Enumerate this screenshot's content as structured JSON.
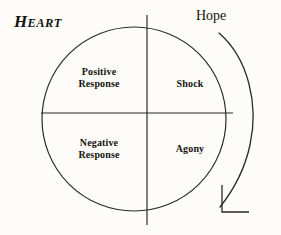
{
  "diagram": {
    "type": "quadrant-circle",
    "background_color": "#fdfcf8",
    "stroke_color": "#2b2a28",
    "text_color": "#15130f",
    "axis_labels": {
      "left_top": "Heart",
      "left_top_cap": "H",
      "left_top_rest": "EART",
      "right_top": "Hope"
    },
    "quadrants": [
      {
        "id": "upper-left",
        "label": "Positive\nResponse"
      },
      {
        "id": "upper-right",
        "label": "Shock"
      },
      {
        "id": "lower-left",
        "label": "Negative\nResponse"
      },
      {
        "id": "lower-right",
        "label": "Agony"
      }
    ],
    "arrow": {
      "name": "clockwise-arrow",
      "direction": "clockwise-downward",
      "head_style": "open-corner"
    },
    "icons": {
      "circle": "circle-outline-icon",
      "vertical_divider": "vertical-divider-icon",
      "horizontal_divider": "horizontal-divider-icon",
      "arrow": "curved-arrow-icon"
    }
  }
}
